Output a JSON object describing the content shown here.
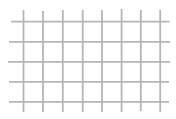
{
  "image": {
    "description": "Square wire mesh grid pattern: light gray wires crossing on a white background, wire ends overhanging the outer crossings",
    "background_color": "#ffffff",
    "wire_color": "#b4b6b6",
    "wire_thickness_px": 1.8,
    "wire_edge_softness_px": 0.3,
    "grid": {
      "vertical_wire_count": 8,
      "horizontal_wire_count": 5,
      "inner_columns": 7,
      "inner_rows": 4,
      "cell_size_px": 20
    },
    "vertical_wires": [
      {
        "x": 23.5,
        "y1": 10,
        "y2": 112
      },
      {
        "x": 43.0,
        "y1": 11,
        "y2": 112
      },
      {
        "x": 62.8,
        "y1": 10,
        "y2": 112
      },
      {
        "x": 82.7,
        "y1": 10,
        "y2": 112
      },
      {
        "x": 102.0,
        "y1": 10,
        "y2": 112
      },
      {
        "x": 121.6,
        "y1": 9,
        "y2": 112
      },
      {
        "x": 140.8,
        "y1": 10,
        "y2": 111
      },
      {
        "x": 160.2,
        "y1": 10,
        "y2": 112
      }
    ],
    "horizontal_wires": [
      {
        "y": 21.7,
        "x1": 11,
        "x2": 169.5
      },
      {
        "y": 41.8,
        "x1": 9,
        "x2": 170.0
      },
      {
        "y": 61.8,
        "x1": 8,
        "x2": 170.0
      },
      {
        "y": 81.8,
        "x1": 9,
        "x2": 169.0
      },
      {
        "y": 101.8,
        "x1": 9,
        "x2": 169.0
      }
    ]
  }
}
